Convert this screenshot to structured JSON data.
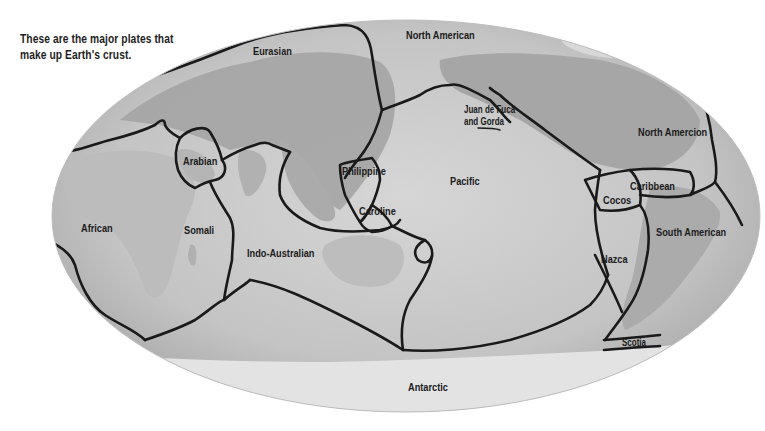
{
  "caption": {
    "line1": "These are the major plates that",
    "line2": "make up Earth's crust."
  },
  "map": {
    "projection": "ellipse world map (Mollweide-style)",
    "colors": {
      "ocean": "#c9c9c9",
      "land": "#a9a9a9",
      "ice": "#e6e6e6",
      "boundary": "#1a1a1a",
      "background": "#ffffff"
    },
    "plates": [
      {
        "id": "eurasian",
        "label": "Eurasian"
      },
      {
        "id": "north-american-top",
        "label": "North American"
      },
      {
        "id": "juan-de-fuca",
        "label": "Juan de Fuca",
        "label2": "and Gorda"
      },
      {
        "id": "north-american-right",
        "label": "North Amercion"
      },
      {
        "id": "arabian",
        "label": "Arabian"
      },
      {
        "id": "philippine",
        "label": "Philippine"
      },
      {
        "id": "pacific",
        "label": "Pacific"
      },
      {
        "id": "caribbean",
        "label": "Caribbean"
      },
      {
        "id": "cocos",
        "label": "Cocos"
      },
      {
        "id": "caroline",
        "label": "Caroline"
      },
      {
        "id": "african",
        "label": "African"
      },
      {
        "id": "somali",
        "label": "Somali"
      },
      {
        "id": "south-american",
        "label": "South American"
      },
      {
        "id": "indo-australian",
        "label": "Indo-Australian"
      },
      {
        "id": "nazca",
        "label": "Nazca"
      },
      {
        "id": "scotia",
        "label": "Scotia"
      },
      {
        "id": "antarctic",
        "label": "Antarctic"
      }
    ]
  }
}
